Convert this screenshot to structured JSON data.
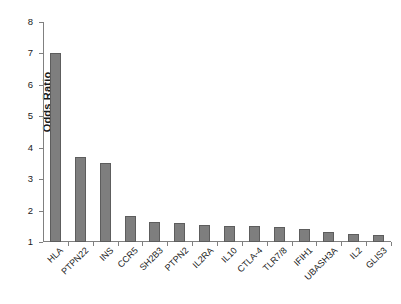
{
  "chart_data": {
    "type": "bar",
    "title": "",
    "subtitle": "",
    "xlabel": "",
    "ylabel": "Odds Ratio",
    "ylim": [
      1,
      8
    ],
    "yticks": [
      1,
      2,
      3,
      4,
      5,
      6,
      7,
      8
    ],
    "ytick_labels": [
      "1",
      "2",
      "3",
      "4",
      "5",
      "6",
      "7",
      "8"
    ],
    "grid": false,
    "legend": null,
    "bar_color": "#7e7e7e",
    "bar_edge_color": "#5d5d5d",
    "axis_color": "#808080",
    "categories": [
      "HLA",
      "PTPN22",
      "INS",
      "CCR5",
      "SH2B3",
      "PTPN2",
      "IL2RA",
      "IL10",
      "CTLA-4",
      "TLR7/8",
      "IFIH1",
      "UBASH3A",
      "IL2",
      "GLIS3"
    ],
    "values": [
      7.0,
      3.7,
      3.5,
      1.83,
      1.65,
      1.6,
      1.55,
      1.52,
      1.5,
      1.47,
      1.41,
      1.31,
      1.25,
      1.22
    ],
    "xtick_rotation": -45
  }
}
